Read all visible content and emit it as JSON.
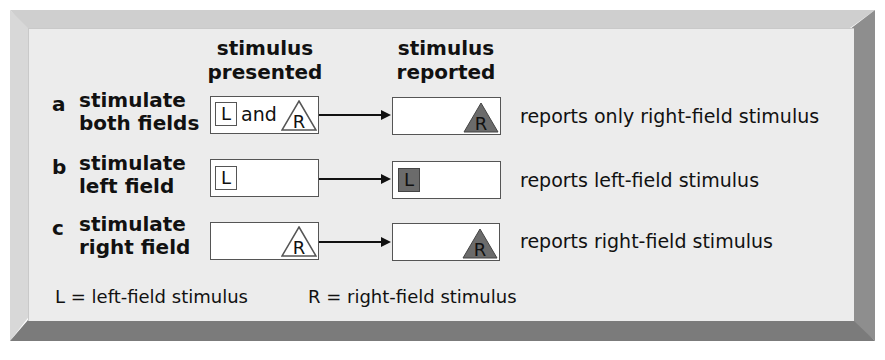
{
  "headers": {
    "presented": [
      "stimulus",
      "presented"
    ],
    "reported": [
      "stimulus",
      "reported"
    ]
  },
  "rows": [
    {
      "letter": "a",
      "label": [
        "stimulate",
        "both fields"
      ],
      "presented": {
        "left_symbol": "L",
        "connector": "and",
        "right_symbol": "R"
      },
      "reported": {
        "symbol": "R"
      },
      "description": "reports only right-field stimulus"
    },
    {
      "letter": "b",
      "label": [
        "stimulate",
        "left field"
      ],
      "presented": {
        "left_symbol": "L"
      },
      "reported": {
        "symbol": "L"
      },
      "description": "reports left-field stimulus"
    },
    {
      "letter": "c",
      "label": [
        "stimulate",
        "right field"
      ],
      "presented": {
        "right_symbol": "R"
      },
      "reported": {
        "symbol": "R"
      },
      "description": "reports right-field stimulus"
    }
  ],
  "legend": {
    "left": "L = left-field stimulus",
    "right": "R = right-field stimulus"
  },
  "colors": {
    "panel": "#ececec",
    "filled_stimulus": "#6b6b6b",
    "box_border": "#555555"
  },
  "icons": {
    "left_stimulus": "square-icon",
    "right_stimulus": "triangle-icon"
  }
}
